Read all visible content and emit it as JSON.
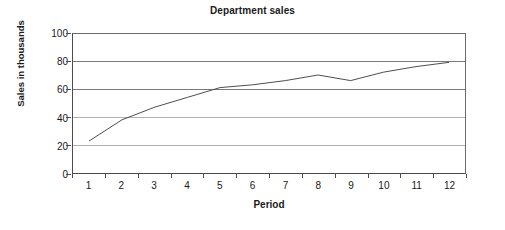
{
  "chart_data": {
    "type": "line",
    "title": "Department sales",
    "xlabel": "Period",
    "ylabel": "Sales in thousands",
    "categories": [
      "1",
      "2",
      "3",
      "4",
      "5",
      "6",
      "7",
      "8",
      "9",
      "10",
      "11",
      "12"
    ],
    "x": [
      1,
      2,
      3,
      4,
      5,
      6,
      7,
      8,
      9,
      10,
      11,
      12
    ],
    "values": [
      23,
      38,
      47,
      54,
      61,
      63,
      66,
      70,
      66,
      72,
      76,
      79
    ],
    "series": [
      {
        "name": "Sales",
        "values": [
          23,
          38,
          47,
          54,
          61,
          63,
          66,
          70,
          66,
          72,
          76,
          79
        ]
      }
    ],
    "ylim": [
      0,
      100
    ],
    "yticks": [
      0,
      20,
      40,
      60,
      80,
      100
    ],
    "ytick_labels": [
      "0",
      "20",
      "40",
      "60",
      "80",
      "100"
    ],
    "xlim": [
      0.5,
      12.5
    ],
    "grid": true,
    "grid_axis": "y",
    "legend": false,
    "legend_position": "none",
    "markers": false,
    "line_color": "#4d4d4d",
    "grid_color": "#7a7a7a",
    "axis_color": "#4d4d4d",
    "background_color": "#ffffff",
    "text_color": "#1a1a1a"
  }
}
